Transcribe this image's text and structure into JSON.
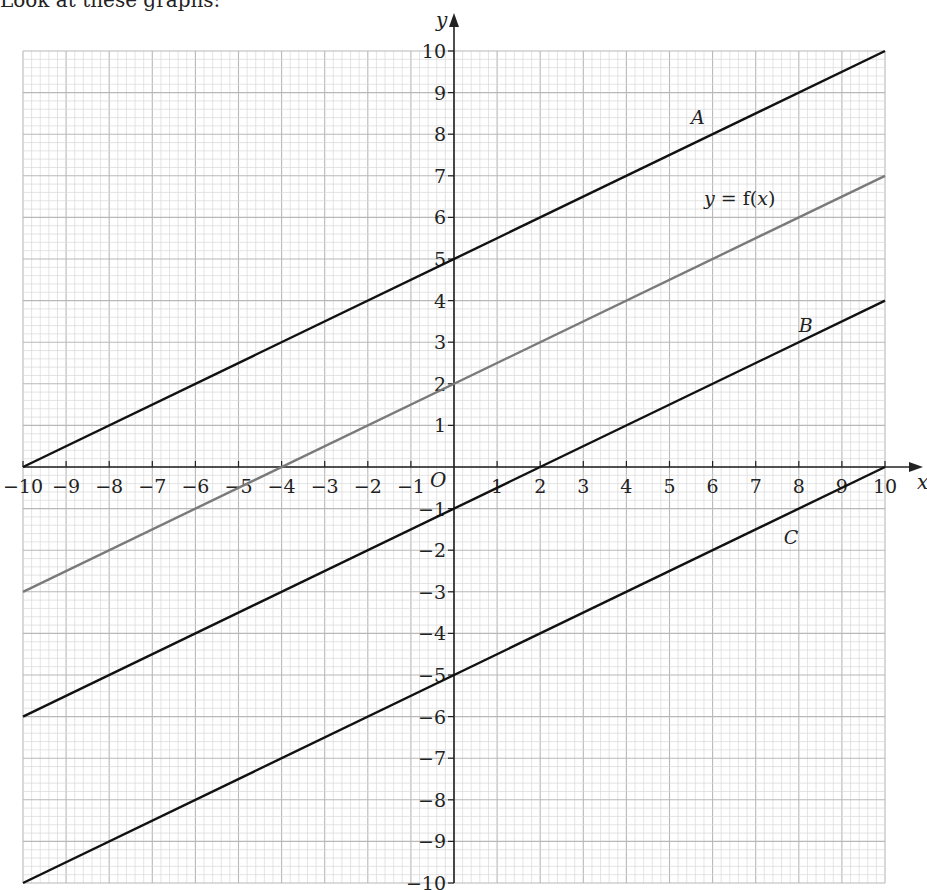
{
  "intro_text": "Look at these graphs:",
  "chart_data": {
    "type": "line",
    "title": "",
    "xlabel": "x",
    "ylabel": "y",
    "xlim": [
      -10,
      10
    ],
    "ylim": [
      -10,
      10
    ],
    "grid": true,
    "grid_minor_step": 0.2,
    "origin_label": "O",
    "x_ticks": [
      -10,
      -9,
      -8,
      -7,
      -6,
      -5,
      -4,
      -3,
      -2,
      -1,
      1,
      2,
      3,
      4,
      5,
      6,
      7,
      8,
      9,
      10
    ],
    "y_ticks": [
      -10,
      -9,
      -8,
      -7,
      -6,
      -5,
      -4,
      -3,
      -2,
      -1,
      1,
      2,
      3,
      4,
      5,
      6,
      7,
      8,
      9,
      10
    ],
    "series": [
      {
        "name": "A",
        "equation": "y = 0.5x + 5",
        "x": [
          -10,
          10
        ],
        "y": [
          0,
          10
        ],
        "color": "#111111",
        "label_pos": [
          5.5,
          8.25
        ]
      },
      {
        "name": "y = f(x)",
        "equation": "y = 0.5x + 2",
        "x": [
          -10,
          10
        ],
        "y": [
          -3,
          7
        ],
        "color": "#7a7a7a",
        "label_pos": [
          5.8,
          6.3
        ]
      },
      {
        "name": "B",
        "equation": "y = 0.5x - 1",
        "x": [
          -10,
          10
        ],
        "y": [
          -6,
          4
        ],
        "color": "#111111",
        "label_pos": [
          8.0,
          3.25
        ]
      },
      {
        "name": "C",
        "equation": "y = 0.5x - 5",
        "x": [
          -10,
          10
        ],
        "y": [
          -10,
          0
        ],
        "color": "#111111",
        "label_pos": [
          7.65,
          -1.85
        ]
      }
    ]
  },
  "colors": {
    "grid_minor": "#d9d9d9",
    "grid_major": "#b8b8b8",
    "axis": "#222222"
  }
}
